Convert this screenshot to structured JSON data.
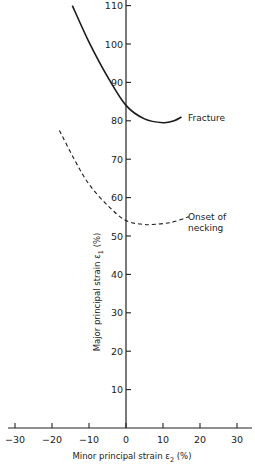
{
  "chart_data": {
    "type": "line",
    "title": "",
    "xlabel": "Minor principal strain ε₂ (%)",
    "ylabel": "Major principal strain ε₁ (%)",
    "xlim": [
      -32,
      34
    ],
    "ylim": [
      0,
      111
    ],
    "x_ticks": [
      -30,
      -20,
      -10,
      0,
      10,
      20,
      30
    ],
    "x_tick_labels": [
      "−30",
      "−20",
      "−10",
      "0",
      "10",
      "20",
      "30"
    ],
    "y_ticks": [
      10,
      20,
      30,
      40,
      50,
      60,
      70,
      80,
      90,
      100,
      110
    ],
    "y_tick_labels": [
      "10",
      "20",
      "30",
      "40",
      "50",
      "60",
      "70",
      "80",
      "90",
      "100",
      "110"
    ],
    "grid": false,
    "legend": "none (inline annotations)",
    "series": [
      {
        "name": "Fracture",
        "style": "solid",
        "x": [
          -14.5,
          -10,
          -5,
          0,
          5,
          10,
          13,
          15
        ],
        "y": [
          110,
          100.5,
          91.5,
          84,
          80.5,
          79.5,
          80,
          81
        ]
      },
      {
        "name": "Onset of necking",
        "style": "dashed",
        "x": [
          -18,
          -14,
          -10,
          -5,
          0,
          5,
          7,
          12,
          17
        ],
        "y": [
          77.5,
          70,
          63.5,
          58,
          54,
          53,
          53,
          53.5,
          55
        ]
      }
    ],
    "annotations": [
      {
        "text": "Fracture",
        "x": 16,
        "y": 81
      },
      {
        "text": "Onset of",
        "x": 18,
        "y": 55.5
      },
      {
        "text": "necking",
        "x": 18,
        "y": 52.5
      }
    ]
  },
  "labels": {
    "fracture": "Fracture",
    "necking_line1": "Onset of",
    "necking_line2": "necking",
    "xlabel_main": "Minor principal strain ",
    "xlabel_sym": "ε",
    "xlabel_sub": "2",
    "xlabel_unit": " (%)",
    "ylabel_main": "Major principal strain ",
    "ylabel_sym": "ε",
    "ylabel_sub": "1",
    "ylabel_unit": " (%)"
  }
}
